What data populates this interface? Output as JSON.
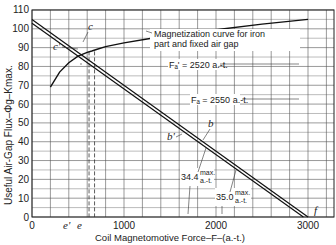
{
  "chart_data": {
    "type": "line",
    "title": "",
    "xlabel": "Coil Magnetomotive Force–F–(a.-t.)",
    "ylabel": "Useful Air-Gap Flux–Φg–Kmax.",
    "xlim": [
      0,
      3250
    ],
    "ylim": [
      0,
      110
    ],
    "grid": true,
    "x_ticks": [
      "0",
      "1000",
      "2000",
      "3000"
    ],
    "y_ticks": [
      "0",
      "10",
      "20",
      "30",
      "40",
      "50",
      "60",
      "70",
      "80",
      "90",
      "100",
      "110"
    ],
    "series": [
      {
        "name": "Magnetization curve for iron part and fixed air gap",
        "x": [
          200,
          300,
          400,
          500,
          600,
          650,
          700,
          800,
          1000,
          1300,
          1600,
          2000,
          2500,
          3000
        ],
        "y": [
          69,
          77,
          82,
          85.5,
          87.5,
          88.2,
          89,
          90.5,
          92.5,
          95,
          97,
          99.5,
          102.5,
          105
        ]
      },
      {
        "name": "Load line (34.4 max./a.-t.)",
        "x": [
          0,
          3000
        ],
        "y": [
          105,
          0
        ]
      },
      {
        "name": "Load line (35.0 max./a.-t.)",
        "x": [
          0,
          2950
        ],
        "y": [
          103,
          0
        ]
      }
    ],
    "annotations": [
      {
        "text": "Magnetization curve for iron part and fixed air gap",
        "x": 1050,
        "y": 97
      },
      {
        "text": "F_a' = 2520 a.-t.",
        "x": 1300,
        "y": 81
      },
      {
        "text": "F_a = 2550 a.-t.",
        "x": 1550,
        "y": 65
      },
      {
        "text": "34.4 max./a.-t.",
        "x": 1750,
        "y": 16
      },
      {
        "text": "35.0 max./a.-t.",
        "x": 2000,
        "y": 8
      },
      {
        "text": "c",
        "x": 670,
        "y": 96
      },
      {
        "text": "c'",
        "x": 500,
        "y": 87
      },
      {
        "text": "b",
        "x": 1650,
        "y": 36
      },
      {
        "text": "b'",
        "x": 1300,
        "y": 33
      },
      {
        "text": "e'",
        "x": 620,
        "y": -5
      },
      {
        "text": "e",
        "x": 680,
        "y": -5
      },
      {
        "text": "f",
        "x": 3050,
        "y": 4
      }
    ],
    "dashed_verticals": [
      620,
      680
    ]
  },
  "labels": {
    "x_axis": "Coil Magnetomotive Force–F–(a.-t.)",
    "y_axis": "Useful Air-Gap Flux–Φg–Kmax.",
    "mag_curve_1": "Magnetization curve for iron",
    "mag_curve_2": "part and fixed air gap",
    "fa_prime": "Fₐ' = 2520 a.-t.",
    "fa": "Fₐ = 2550 a.-t.",
    "slope1_val": "34.4",
    "slope2_val": "35.0",
    "slope_num": "max.",
    "slope_den": "a.-t.",
    "c": "c",
    "c_prime": "c'",
    "b": "b",
    "b_prime": "b'",
    "e": "e",
    "e_prime": "e'",
    "f": "f"
  }
}
